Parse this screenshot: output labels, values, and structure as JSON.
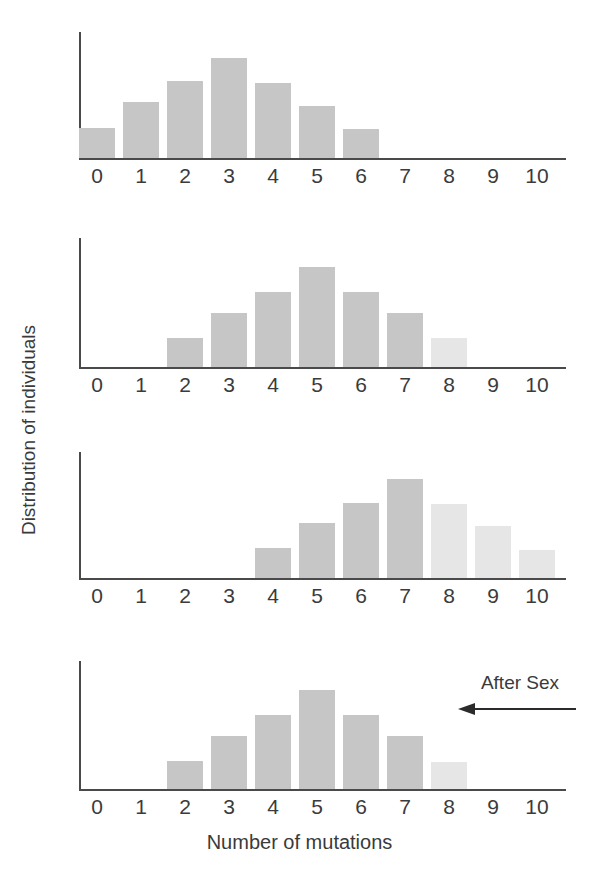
{
  "figure": {
    "xlabel": "Number of mutations",
    "ylabel": "Distribution of individuals",
    "annotation": "After Sex",
    "arrow_icon": "left-arrow-icon",
    "colors": {
      "bar_dark": "#c6c6c6",
      "bar_light": "#e6e6e6",
      "axis": "#4a4a4a",
      "text": "#3a3a3a"
    }
  },
  "chart_data": {
    "type": "bar",
    "title": "",
    "xlabel": "Number of mutations",
    "ylabel": "Distribution of individuals",
    "categories": [
      "0",
      "1",
      "2",
      "3",
      "4",
      "5",
      "6",
      "7",
      "8",
      "9",
      "10"
    ],
    "ylim": [
      0,
      1
    ],
    "grid": false,
    "legend": null,
    "annotations": [
      {
        "text": "After Sex",
        "panel": 4,
        "arrow": "left",
        "x_from": 10,
        "x_to": 8
      }
    ],
    "panels": [
      {
        "index": 1,
        "name": "panel-1",
        "values": [
          0.26,
          0.48,
          0.66,
          0.86,
          0.65,
          0.45,
          0.25,
          0,
          0,
          0,
          0
        ],
        "shades": [
          "dark",
          "dark",
          "dark",
          "dark",
          "dark",
          "dark",
          "dark",
          "none",
          "none",
          "none",
          "none"
        ]
      },
      {
        "index": 2,
        "name": "panel-2",
        "values": [
          0,
          0,
          0.24,
          0.45,
          0.63,
          0.84,
          0.63,
          0.45,
          0.24,
          0,
          0
        ],
        "shades": [
          "none",
          "none",
          "dark",
          "dark",
          "dark",
          "dark",
          "dark",
          "dark",
          "light",
          "none",
          "none"
        ]
      },
      {
        "index": 3,
        "name": "panel-3",
        "values": [
          0,
          0,
          0,
          0,
          0.26,
          0.47,
          0.65,
          0.85,
          0.64,
          0.45,
          0.24
        ],
        "shades": [
          "none",
          "none",
          "none",
          "none",
          "dark",
          "dark",
          "dark",
          "dark",
          "light",
          "light",
          "light"
        ]
      },
      {
        "index": 4,
        "name": "panel-4",
        "values": [
          0,
          0,
          0.24,
          0.45,
          0.63,
          0.84,
          0.63,
          0.45,
          0.23,
          0,
          0
        ],
        "shades": [
          "none",
          "none",
          "dark",
          "dark",
          "dark",
          "dark",
          "dark",
          "dark",
          "light",
          "none",
          "none"
        ]
      }
    ]
  },
  "ticks": {
    "labels": [
      "0",
      "1",
      "2",
      "3",
      "4",
      "5",
      "6",
      "7",
      "8",
      "9",
      "10"
    ]
  }
}
